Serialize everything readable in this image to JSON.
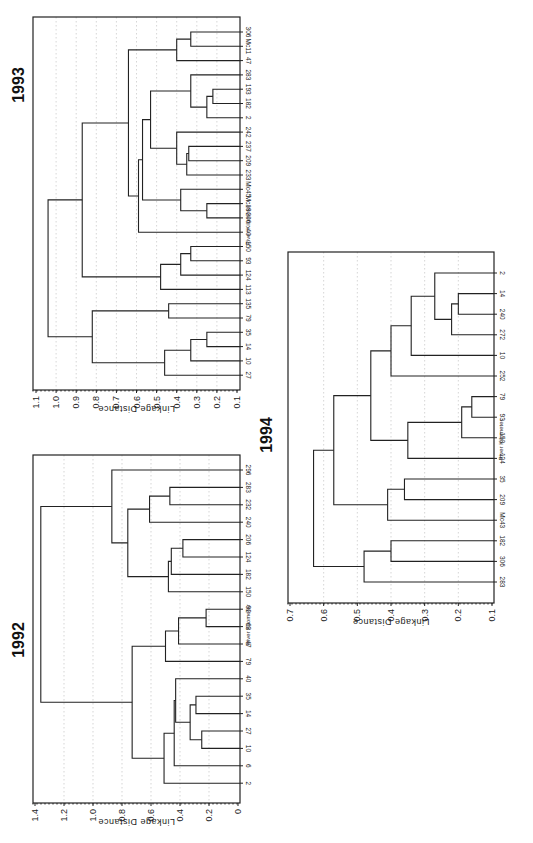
{
  "chart_data": [
    {
      "type": "dendrogram",
      "title": "1993",
      "xlabel": "River Kilometer",
      "ylabel": "Linkage Distance",
      "ylim": [
        0.1,
        1.1
      ],
      "ticks": [
        "1.1",
        "1.0",
        "0.9",
        "0.8",
        "0.7",
        "0.6",
        "0.5",
        "0.4",
        "0.3",
        "0.2",
        "0.1"
      ],
      "leaves": [
        "306",
        "Mc11",
        "47",
        "283",
        "193",
        "182",
        "2",
        "242",
        "237",
        "209",
        "233",
        "Mc45",
        "Mc19",
        "206",
        "40",
        "150",
        "93",
        "124",
        "113",
        "135",
        "79",
        "35",
        "14",
        "10",
        "27"
      ],
      "merges": [
        {
          "a": "306",
          "b": "Mc11",
          "d": 0.33
        },
        {
          "a": "m0",
          "b": "47",
          "d": 0.4
        },
        {
          "a": "193",
          "b": "182",
          "d": 0.22
        },
        {
          "a": "m2",
          "b": "2",
          "d": 0.25
        },
        {
          "a": "283",
          "b": "m3",
          "d": 0.33
        },
        {
          "a": "237",
          "b": "209",
          "d": 0.34
        },
        {
          "a": "m5",
          "b": "233",
          "d": 0.35
        },
        {
          "a": "242",
          "b": "m6",
          "d": 0.4
        },
        {
          "a": "m4",
          "b": "m7",
          "d": 0.53
        },
        {
          "a": "Mc19",
          "b": "206",
          "d": 0.25
        },
        {
          "a": "Mc45",
          "b": "m9",
          "d": 0.38
        },
        {
          "a": "m8",
          "b": "m10",
          "d": 0.57
        },
        {
          "a": "m11",
          "b": "40",
          "d": 0.59
        },
        {
          "a": "m1",
          "b": "m12",
          "d": 0.64
        },
        {
          "a": "150",
          "b": "93",
          "d": 0.33
        },
        {
          "a": "m14",
          "b": "124",
          "d": 0.38
        },
        {
          "a": "m15",
          "b": "113",
          "d": 0.48
        },
        {
          "a": "m13",
          "b": "m16",
          "d": 0.87
        },
        {
          "a": "135",
          "b": "79",
          "d": 0.44
        },
        {
          "a": "35",
          "b": "14",
          "d": 0.25
        },
        {
          "a": "m19",
          "b": "10",
          "d": 0.33
        },
        {
          "a": "m20",
          "b": "27",
          "d": 0.46
        },
        {
          "a": "m18",
          "b": "m21",
          "d": 0.82
        },
        {
          "a": "m17",
          "b": "m22",
          "d": 1.04
        }
      ],
      "layout": {
        "x0": 33,
        "x1": 240,
        "y0": 17,
        "y1": 390,
        "dmax": 1.1,
        "dmin": 0.1,
        "leafTop": 32,
        "leafStep": 14.3,
        "tickX0": 36,
        "tickX1": 237,
        "titleX": 24,
        "titleY": 85,
        "rkX": 250,
        "rkY": 225
      }
    },
    {
      "type": "dendrogram",
      "title": "1992",
      "xlabel": "River Kilometer",
      "ylabel": "Linkage Distance",
      "ylim": [
        0,
        1.4
      ],
      "ticks": [
        "1.4",
        "1.2",
        "1.0",
        "0.8",
        "0.6",
        "0.4",
        "0.2",
        "0"
      ],
      "leaves": [
        "296",
        "283",
        "232",
        "240",
        "206",
        "124",
        "182",
        "150",
        "92",
        "63",
        "47",
        "79",
        "40",
        "35",
        "14",
        "27",
        "10",
        "6",
        "2"
      ],
      "merges": [
        {
          "a": "283",
          "b": "232",
          "d": 0.47
        },
        {
          "a": "m0",
          "b": "240",
          "d": 0.61
        },
        {
          "a": "206",
          "b": "124",
          "d": 0.38
        },
        {
          "a": "m2",
          "b": "182",
          "d": 0.46
        },
        {
          "a": "m3",
          "b": "150",
          "d": 0.48
        },
        {
          "a": "m1",
          "b": "m4",
          "d": 0.76
        },
        {
          "a": "296",
          "b": "m5",
          "d": 0.87
        },
        {
          "a": "92",
          "b": "63",
          "d": 0.22
        },
        {
          "a": "m7",
          "b": "47",
          "d": 0.41
        },
        {
          "a": "m8",
          "b": "79",
          "d": 0.5
        },
        {
          "a": "35",
          "b": "14",
          "d": 0.29
        },
        {
          "a": "27",
          "b": "10",
          "d": 0.25
        },
        {
          "a": "m10",
          "b": "m11",
          "d": 0.33
        },
        {
          "a": "m12",
          "b": "40",
          "d": 0.43
        },
        {
          "a": "m13",
          "b": "6",
          "d": 0.44
        },
        {
          "a": "m14",
          "b": "2",
          "d": 0.51
        },
        {
          "a": "m9",
          "b": "m15",
          "d": 0.73
        },
        {
          "a": "m6",
          "b": "m16",
          "d": 1.36
        }
      ],
      "layout": {
        "x0": 33,
        "x1": 240,
        "y0": 455,
        "y1": 803,
        "dmax": 1.4,
        "dmin": 0,
        "leafTop": 470,
        "leafStep": 17.4,
        "tickX0": 35,
        "tickX1": 238,
        "titleX": 24,
        "titleY": 640,
        "rkX": 250,
        "rkY": 625
      }
    },
    {
      "type": "dendrogram",
      "title": "1994",
      "xlabel": "River Kilometer",
      "ylabel": "Linkage Distance",
      "ylim": [
        0.1,
        0.7
      ],
      "ticks": [
        "0.7",
        "0.6",
        "0.5",
        "0.4",
        "0.3",
        "0.2",
        "0.1"
      ],
      "leaves": [
        "2",
        "14",
        "240",
        "272",
        "10",
        "252",
        "79",
        "93",
        "150",
        "124",
        "35",
        "209",
        "Mc43",
        "182",
        "306",
        "283"
      ],
      "merges": [
        {
          "a": "14",
          "b": "240",
          "d": 0.2
        },
        {
          "a": "m0",
          "b": "272",
          "d": 0.22
        },
        {
          "a": "2",
          "b": "m1",
          "d": 0.27
        },
        {
          "a": "m2",
          "b": "10",
          "d": 0.34
        },
        {
          "a": "m3",
          "b": "252",
          "d": 0.4
        },
        {
          "a": "79",
          "b": "93",
          "d": 0.16
        },
        {
          "a": "m5",
          "b": "150",
          "d": 0.19
        },
        {
          "a": "m6",
          "b": "124",
          "d": 0.35
        },
        {
          "a": "m4",
          "b": "m7",
          "d": 0.46
        },
        {
          "a": "35",
          "b": "209",
          "d": 0.36
        },
        {
          "a": "m9",
          "b": "Mc43",
          "d": 0.41
        },
        {
          "a": "m8",
          "b": "m10",
          "d": 0.57
        },
        {
          "a": "182",
          "b": "306",
          "d": 0.4
        },
        {
          "a": "m12",
          "b": "283",
          "d": 0.48
        },
        {
          "a": "m11",
          "b": "m13",
          "d": 0.63
        }
      ],
      "layout": {
        "x0": 288,
        "x1": 494,
        "y0": 252,
        "y1": 603,
        "dmax": 0.7,
        "dmin": 0.1,
        "leafTop": 273,
        "leafStep": 20.6,
        "tickX0": 290,
        "tickX1": 492,
        "titleX": 272,
        "titleY": 435,
        "rkX": 503,
        "rkY": 440
      }
    }
  ]
}
